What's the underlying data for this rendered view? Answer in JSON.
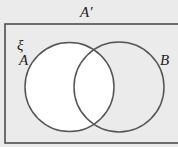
{
  "diagram": {
    "type": "venn",
    "title": "A′",
    "universal_label": "ξ",
    "sets": [
      {
        "label": "A",
        "shaded": false
      },
      {
        "label": "B",
        "shaded": true
      }
    ],
    "shaded_region": "A′",
    "colors": {
      "shaded": "#ebebeb",
      "unshaded": "#ffffff",
      "stroke": "#555555"
    }
  }
}
